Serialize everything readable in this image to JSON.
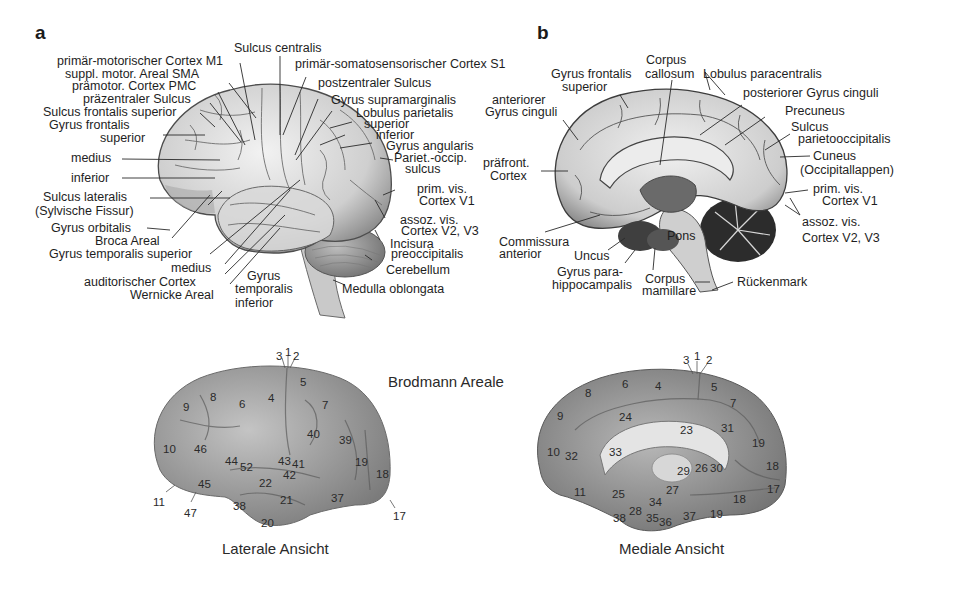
{
  "panel_a": {
    "letter": "a",
    "labels": {
      "sulcus_centralis": "Sulcus centralis",
      "m1": "primär-motorischer Cortex M1",
      "s1": "primär-somatosensorischer Cortex S1",
      "sma": "suppl. motor. Areal SMA",
      "pmc": "prämotor. Cortex PMC",
      "praezentral": "präzentraler Sulcus",
      "postzentral": "postzentraler Sulcus",
      "sulcus_front_sup": "Sulcus frontalis superior",
      "gyrus_supramarg": "Gyrus supramarginalis",
      "gyrus_front": "Gyrus frontalis",
      "superior1": "superior",
      "lobulus_par": "Lobulus parietalis",
      "lob_superior": "superior",
      "lob_inferior": "inferior",
      "medius1": "medius",
      "inferior1": "inferior",
      "gyrus_angularis": "Gyrus angularis",
      "pariet_occ": "Pariet.-occip.",
      "sulcus": "sulcus",
      "sulcus_lat": "Sulcus lateralis",
      "sylvische": "(Sylvische Fissur)",
      "prim_vis": "prim. vis.",
      "cortex_v1": "Cortex V1",
      "gyrus_orbitalis": "Gyrus orbitalis",
      "assoz_vis": "assoz. vis.",
      "cortex_v23": "Cortex V2, V3",
      "broca": "Broca Areal",
      "incisura": "Incisura",
      "preocc": "preoccipitalis",
      "gyrus_temp_sup": "Gyrus temporalis superior",
      "medius2": "medius",
      "cerebellum": "Cerebellum",
      "auditorisch": "auditorischer Cortex",
      "gyrus": "Gyrus",
      "temporalis": "temporalis",
      "inferior2": "inferior",
      "wernicke": "Wernicke Areal",
      "medulla": "Medulla oblongata"
    }
  },
  "panel_b": {
    "letter": "b",
    "labels": {
      "corpus": "Corpus",
      "callosum": "callosum",
      "gyrus_front": "Gyrus frontalis",
      "superior": "superior",
      "lobulus_para": "Lobulus paracentralis",
      "post_cinguli": "posteriorer Gyrus cinguli",
      "anteriorer": "anteriorer",
      "gyrus_cinguli": "Gyrus cinguli",
      "precuneus": "Precuneus",
      "sulcus": "Sulcus",
      "parietoocc": "parietooccipitalis",
      "praefront": "präfront.",
      "cortex": "Cortex",
      "cuneus": "Cuneus",
      "occipitallappen": "(Occipitallappen)",
      "prim_vis": "prim. vis.",
      "cortex_v1": "Cortex V1",
      "assoz_vis": "assoz. vis.",
      "cortex_v23": "Cortex V2, V3",
      "pons": "Pons",
      "commissura": "Commissura",
      "anterior": "anterior",
      "uncus": "Uncus",
      "gyrus_para": "Gyrus para-",
      "hippocampalis": "hippocampalis",
      "corpus2": "Corpus",
      "mamillare": "mamillare",
      "rueckenmark": "Rückenmark"
    }
  },
  "brodmann": {
    "title": "Brodmann Areale",
    "lateral_caption": "Laterale Ansicht",
    "medial_caption": "Mediale Ansicht",
    "lateral_areas": [
      {
        "n": "3",
        "x": 276,
        "y": 350
      },
      {
        "n": "1",
        "x": 285,
        "y": 346
      },
      {
        "n": "2",
        "x": 293,
        "y": 350
      },
      {
        "n": "5",
        "x": 300,
        "y": 376
      },
      {
        "n": "4",
        "x": 268,
        "y": 392
      },
      {
        "n": "6",
        "x": 239,
        "y": 398
      },
      {
        "n": "8",
        "x": 210,
        "y": 391
      },
      {
        "n": "9",
        "x": 183,
        "y": 401
      },
      {
        "n": "7",
        "x": 322,
        "y": 399
      },
      {
        "n": "40",
        "x": 307,
        "y": 428
      },
      {
        "n": "39",
        "x": 339,
        "y": 434
      },
      {
        "n": "10",
        "x": 163,
        "y": 443
      },
      {
        "n": "46",
        "x": 194,
        "y": 443
      },
      {
        "n": "44",
        "x": 225,
        "y": 455
      },
      {
        "n": "52",
        "x": 240,
        "y": 461
      },
      {
        "n": "43",
        "x": 278,
        "y": 455
      },
      {
        "n": "41",
        "x": 292,
        "y": 458
      },
      {
        "n": "42",
        "x": 283,
        "y": 469
      },
      {
        "n": "19",
        "x": 355,
        "y": 456
      },
      {
        "n": "18",
        "x": 376,
        "y": 468
      },
      {
        "n": "45",
        "x": 198,
        "y": 478
      },
      {
        "n": "22",
        "x": 259,
        "y": 477
      },
      {
        "n": "11",
        "x": 153,
        "y": 496
      },
      {
        "n": "47",
        "x": 184,
        "y": 507
      },
      {
        "n": "38",
        "x": 233,
        "y": 500
      },
      {
        "n": "21",
        "x": 280,
        "y": 494
      },
      {
        "n": "37",
        "x": 331,
        "y": 492
      },
      {
        "n": "20",
        "x": 261,
        "y": 517
      },
      {
        "n": "17",
        "x": 393,
        "y": 510
      }
    ],
    "medial_areas": [
      {
        "n": "3",
        "x": 683,
        "y": 354
      },
      {
        "n": "1",
        "x": 694,
        "y": 350
      },
      {
        "n": "2",
        "x": 706,
        "y": 354
      },
      {
        "n": "6",
        "x": 622,
        "y": 378
      },
      {
        "n": "4",
        "x": 655,
        "y": 380
      },
      {
        "n": "5",
        "x": 711,
        "y": 381
      },
      {
        "n": "8",
        "x": 585,
        "y": 387
      },
      {
        "n": "7",
        "x": 730,
        "y": 397
      },
      {
        "n": "9",
        "x": 557,
        "y": 410
      },
      {
        "n": "24",
        "x": 619,
        "y": 411
      },
      {
        "n": "23",
        "x": 680,
        "y": 424
      },
      {
        "n": "31",
        "x": 721,
        "y": 422
      },
      {
        "n": "19",
        "x": 752,
        "y": 437
      },
      {
        "n": "10",
        "x": 547,
        "y": 446
      },
      {
        "n": "32",
        "x": 565,
        "y": 450
      },
      {
        "n": "33",
        "x": 609,
        "y": 446
      },
      {
        "n": "18",
        "x": 766,
        "y": 460
      },
      {
        "n": "29",
        "x": 677,
        "y": 465
      },
      {
        "n": "26",
        "x": 695,
        "y": 462
      },
      {
        "n": "30",
        "x": 710,
        "y": 462
      },
      {
        "n": "11",
        "x": 574,
        "y": 486
      },
      {
        "n": "25",
        "x": 612,
        "y": 488
      },
      {
        "n": "27",
        "x": 666,
        "y": 484
      },
      {
        "n": "17",
        "x": 767,
        "y": 483
      },
      {
        "n": "34",
        "x": 649,
        "y": 496
      },
      {
        "n": "18",
        "x": 733,
        "y": 493
      },
      {
        "n": "28",
        "x": 629,
        "y": 505
      },
      {
        "n": "35",
        "x": 646,
        "y": 512
      },
      {
        "n": "38",
        "x": 613,
        "y": 512
      },
      {
        "n": "36",
        "x": 659,
        "y": 516
      },
      {
        "n": "37",
        "x": 683,
        "y": 510
      },
      {
        "n": "19",
        "x": 710,
        "y": 508
      }
    ]
  }
}
